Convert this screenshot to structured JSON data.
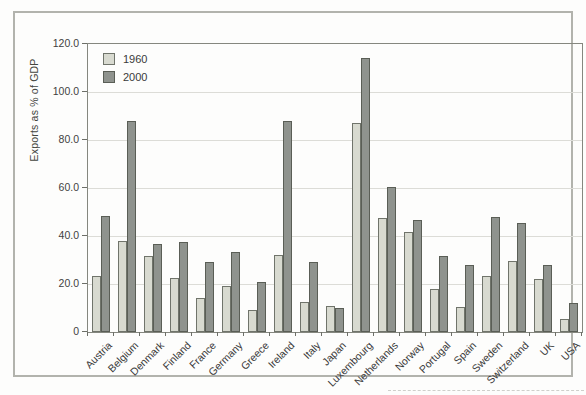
{
  "chart_data": {
    "type": "bar",
    "title": "",
    "ylabel": "Exports as % of GDP",
    "xlabel": "",
    "ylim": [
      0,
      120
    ],
    "yticks": [
      0,
      20,
      40,
      60,
      80,
      100,
      120
    ],
    "ytick_labels": [
      "0",
      "20.0",
      "40.0",
      "60.0",
      "80.0",
      "100.0",
      "120.0"
    ],
    "grid": "horizontal",
    "legend_position": "top-left-inside",
    "categories": [
      "Austria",
      "Belgium",
      "Denmark",
      "Finland",
      "France",
      "Germany",
      "Greece",
      "Ireland",
      "Italy",
      "Japan",
      "Luxembourg",
      "Netherlands",
      "Norway",
      "Portugal",
      "Spain",
      "Sweden",
      "Switzerland",
      "UK",
      "USA"
    ],
    "series": [
      {
        "name": "1960",
        "color": "#d8dad0",
        "border_color": "#70746b",
        "values": [
          23.5,
          38,
          31.5,
          22.5,
          14,
          19,
          9,
          32,
          12.5,
          11,
          87,
          47.5,
          41.5,
          18,
          10.5,
          23.5,
          29.5,
          22,
          5.5
        ]
      },
      {
        "name": "2000",
        "color": "#8f938e",
        "border_color": "#5a5e56",
        "values": [
          48.5,
          88,
          36.5,
          37.5,
          29,
          33.5,
          21,
          88,
          29,
          10,
          114,
          60.5,
          46.5,
          31.5,
          28,
          48,
          45.5,
          28,
          12
        ]
      }
    ],
    "colors": {
      "figure_frame_border": "#b2b3ad",
      "plot_border": "#85877f",
      "gridline": "#dcdcd7",
      "text": "#3f3f3f",
      "background": "#fdfdfc"
    }
  }
}
